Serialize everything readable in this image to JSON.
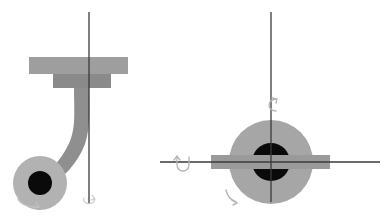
{
  "figure": {
    "title": "",
    "background": "#ffffff",
    "width": 387,
    "height": 217
  },
  "colors": {
    "plate_light": "#9e9e9e",
    "plate_dark": "#8a8a8a",
    "arm": "#8f8f8f",
    "ball_outer": "#b2b2b2",
    "ball_inner": "#0a0a0a",
    "sphere": "#a6a6a6",
    "bar": "#9a9a9a",
    "axis_line": "#3a3a3a",
    "arrow_faint": "#b9b9b9",
    "arrow_mid": "#8d8d8d"
  },
  "views": [
    {
      "id": "side-view",
      "name": "side-elevation-view",
      "label": "",
      "parts": [
        {
          "id": "upper-plate",
          "name": "upper-mounting-plate",
          "label": "",
          "shape": "rectangle",
          "x": 29,
          "y": 57,
          "width": 99,
          "height": 17,
          "fill": "plate_light"
        },
        {
          "id": "lower-plate",
          "name": "lower-mounting-plate",
          "label": "",
          "shape": "rectangle",
          "x": 53,
          "y": 74,
          "width": 58,
          "height": 14,
          "fill": "plate_dark"
        },
        {
          "id": "swan-arm",
          "name": "curved-swan-neck-arm",
          "label": "",
          "shape": "path",
          "fill": "arm"
        },
        {
          "id": "wheel-outer",
          "name": "wheel-outer-disc",
          "label": "",
          "shape": "circle",
          "cx": 40,
          "cy": 183,
          "r": 27,
          "fill": "ball_outer"
        },
        {
          "id": "wheel-hub",
          "name": "wheel-hub",
          "label": "",
          "shape": "circle",
          "cx": 40,
          "cy": 183,
          "r": 12,
          "fill": "ball_inner"
        },
        {
          "id": "vertical-axis",
          "name": "vertical-rotation-axis-line",
          "label": "",
          "shape": "line",
          "x1": 89,
          "y1": 12,
          "x2": 89,
          "y2": 203,
          "stroke": "axis_line"
        }
      ],
      "annotations": [
        {
          "id": "swivel-arc",
          "name": "swivel-rotation-arrow",
          "label": "",
          "type": "arc-arrow"
        },
        {
          "id": "axis-end-arrow",
          "name": "axis-end-rotation-arrow",
          "label": "",
          "type": "arc-arrow"
        }
      ]
    },
    {
      "id": "front-view",
      "name": "front-elevation-view",
      "label": "",
      "parts": [
        {
          "id": "sphere",
          "name": "spherical-body",
          "label": "",
          "shape": "circle",
          "cx": 271,
          "cy": 162,
          "r": 42,
          "fill": "sphere"
        },
        {
          "id": "sphere-hub",
          "name": "sphere-hub",
          "label": "",
          "shape": "circle",
          "cx": 271,
          "cy": 162,
          "r": 19,
          "fill": "ball_inner"
        },
        {
          "id": "cross-bar",
          "name": "horizontal-cross-bar",
          "label": "",
          "shape": "rectangle",
          "x": 211,
          "y": 155,
          "width": 119,
          "height": 14,
          "fill": "bar"
        },
        {
          "id": "vertical-axis-2",
          "name": "vertical-rotation-axis-line",
          "label": "",
          "shape": "line",
          "x1": 271,
          "y1": 12,
          "x2": 271,
          "y2": 202,
          "stroke": "axis_line"
        },
        {
          "id": "horizontal-axis",
          "name": "horizontal-rotation-axis-line",
          "label": "",
          "shape": "line",
          "x1": 160,
          "y1": 162,
          "x2": 380,
          "y2": 162,
          "stroke": "axis_line"
        }
      ],
      "annotations": [
        {
          "id": "vert-spin-arrow",
          "name": "vertical-axis-spin-arrow",
          "label": "",
          "type": "circular-arrow"
        },
        {
          "id": "horiz-spin-arrow",
          "name": "horizontal-axis-spin-arrow",
          "label": "",
          "type": "u-arrow"
        },
        {
          "id": "roll-arc-arrow",
          "name": "roll-direction-arc-arrow",
          "label": "",
          "type": "arc-arrow"
        }
      ]
    }
  ]
}
